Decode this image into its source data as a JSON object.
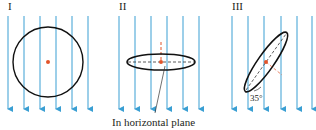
{
  "colors": {
    "field_line": "#3a9fd3",
    "loop": "#111111",
    "center_dot": "#e2542a",
    "dashed_axis": "#333333",
    "normal_line": "#e2542a",
    "text": "#231f20"
  },
  "panels": [
    {
      "label": "I",
      "orientation": "loop perpendicular to page plane, face-on circle",
      "field_lines_x": [
        8,
        24,
        40,
        56,
        72,
        88
      ]
    },
    {
      "label": "II",
      "orientation": "loop in horizontal plane (edge view ellipse)",
      "field_lines_x": [
        119,
        135,
        151,
        167,
        183,
        199
      ],
      "caption": "In horizontal plane"
    },
    {
      "label": "III",
      "orientation": "loop tilted",
      "field_lines_x": [
        232,
        248,
        264,
        281,
        297,
        312
      ],
      "angle_label": "35°"
    }
  ],
  "field_direction": "downward"
}
